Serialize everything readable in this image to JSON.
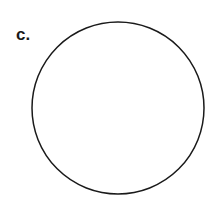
{
  "figure": {
    "label": "c.",
    "shape": "circle",
    "circle": {
      "cx": 118,
      "cy": 108,
      "r": 86,
      "stroke": "#1a1a1a",
      "fill": "#ffffff",
      "stroke_width": 1.5
    }
  }
}
